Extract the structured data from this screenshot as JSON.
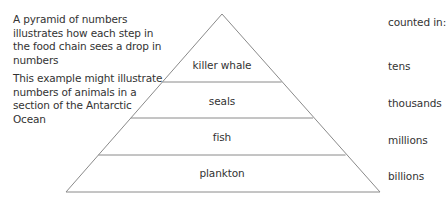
{
  "description": {
    "paragraph_1": "A pyramid of numbers illustrates how each step in the food chain sees a drop in numbers",
    "paragraph_2": "This example might illustrate numbers of animals in a section of the Antarctic Ocean"
  },
  "counts_header": "counted in:",
  "tiers": [
    {
      "organism": "killer whale",
      "counted_in": "tens"
    },
    {
      "organism": "seals",
      "counted_in": "thousands"
    },
    {
      "organism": "fish",
      "counted_in": "millions"
    },
    {
      "organism": "plankton",
      "counted_in": "billions"
    }
  ],
  "colors": {
    "line": "#8a8a8a",
    "text": "#333333",
    "background": "#ffffff"
  }
}
